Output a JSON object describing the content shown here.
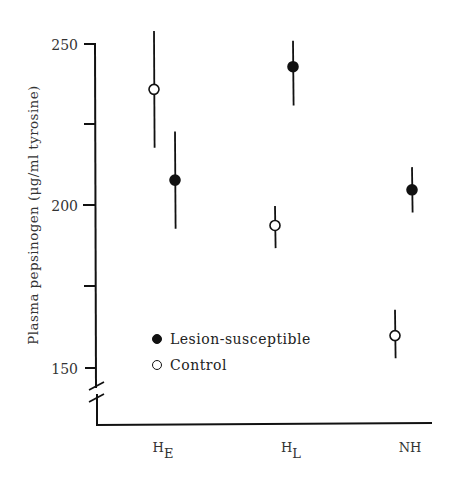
{
  "chart_data": {
    "type": "scatter",
    "title": "",
    "xlabel": "",
    "ylabel": "Plasma pepsinogen (μg/ml tyrosine)",
    "categories": [
      {
        "base": "H",
        "sub": "E"
      },
      {
        "base": "H",
        "sub": "L"
      },
      {
        "base": "NH",
        "sub": ""
      }
    ],
    "y_ticks": [
      150,
      200,
      250
    ],
    "y_minor_ticks": [
      175,
      225
    ],
    "ylim": [
      138,
      252
    ],
    "axis_break": true,
    "grid": false,
    "legend_position": "lower-left inside",
    "series": [
      {
        "name": "Lesion-susceptible",
        "marker": "filled-circle",
        "values": [
          208,
          243,
          205
        ],
        "error_low": [
          193,
          231,
          198
        ],
        "error_high": [
          223,
          251,
          212
        ]
      },
      {
        "name": "Control",
        "marker": "open-circle",
        "values": [
          236,
          194,
          160
        ],
        "error_low": [
          218,
          187,
          153
        ],
        "error_high": [
          254,
          200,
          168
        ]
      }
    ]
  },
  "legend": {
    "items": [
      {
        "label": "Lesion-susceptible",
        "marker": "filled"
      },
      {
        "label": "Control",
        "marker": "open"
      }
    ]
  },
  "axis": {
    "y_tick_labels": [
      "250",
      "200",
      "150"
    ]
  },
  "x_labels": [
    {
      "base": "H",
      "sub": "E"
    },
    {
      "base": "H",
      "sub": "L"
    },
    {
      "base": "NH",
      "sub": ""
    }
  ]
}
